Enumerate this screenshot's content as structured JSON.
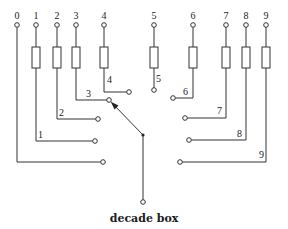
{
  "caption": "decade box",
  "colors": {
    "line": "#333333",
    "background": "#ffffff"
  },
  "top_terminals": [
    {
      "label": "0",
      "x": 17
    },
    {
      "label": "1",
      "x": 36
    },
    {
      "label": "2",
      "x": 57
    },
    {
      "label": "3",
      "x": 76
    },
    {
      "label": "4",
      "x": 104
    },
    {
      "label": "5",
      "x": 154
    },
    {
      "label": "6",
      "x": 193
    },
    {
      "label": "7",
      "x": 226
    },
    {
      "label": "8",
      "x": 246
    },
    {
      "label": "9",
      "x": 266
    }
  ],
  "switch_contacts": [
    {
      "label": "0",
      "side": "left"
    },
    {
      "label": "1",
      "side": "left"
    },
    {
      "label": "2",
      "side": "left"
    },
    {
      "label": "3",
      "side": "left"
    },
    {
      "label": "4",
      "side": "left"
    },
    {
      "label": "5",
      "side": "right"
    },
    {
      "label": "6",
      "side": "right"
    },
    {
      "label": "7",
      "side": "right"
    },
    {
      "label": "8",
      "side": "right"
    },
    {
      "label": "9",
      "side": "right"
    }
  ],
  "wiper": {
    "pointing_to": "3",
    "has_arrow": true
  },
  "resistor_count": 9
}
